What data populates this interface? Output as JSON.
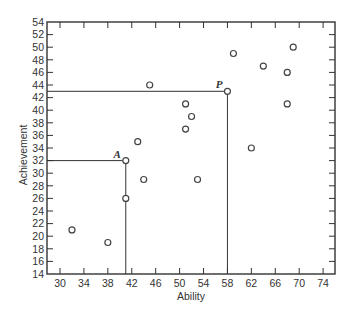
{
  "chart_data": {
    "type": "scatter",
    "title": "",
    "xlabel": "Ability",
    "ylabel": "Achievement",
    "xlim": [
      28,
      76
    ],
    "ylim": [
      14,
      54
    ],
    "xticks": [
      30,
      34,
      38,
      42,
      46,
      50,
      54,
      58,
      62,
      66,
      70,
      74
    ],
    "yticks": [
      14,
      16,
      18,
      20,
      22,
      24,
      26,
      28,
      30,
      32,
      34,
      36,
      38,
      40,
      42,
      44,
      46,
      48,
      50,
      52,
      54
    ],
    "grid": false,
    "legend": null,
    "marker": "open-circle",
    "series": [
      {
        "name": "students",
        "points": [
          {
            "x": 32,
            "y": 21
          },
          {
            "x": 38,
            "y": 19
          },
          {
            "x": 41,
            "y": 32,
            "label": "A"
          },
          {
            "x": 41,
            "y": 26
          },
          {
            "x": 43,
            "y": 35
          },
          {
            "x": 44,
            "y": 29
          },
          {
            "x": 45,
            "y": 44
          },
          {
            "x": 51,
            "y": 41
          },
          {
            "x": 52,
            "y": 39
          },
          {
            "x": 51,
            "y": 37
          },
          {
            "x": 53,
            "y": 29
          },
          {
            "x": 58,
            "y": 43,
            "label": "P"
          },
          {
            "x": 59,
            "y": 49
          },
          {
            "x": 62,
            "y": 34
          },
          {
            "x": 64,
            "y": 47
          },
          {
            "x": 68,
            "y": 46
          },
          {
            "x": 68,
            "y": 41
          },
          {
            "x": 69,
            "y": 50
          }
        ]
      }
    ],
    "annotations": [
      {
        "label": "A",
        "x": 41,
        "y": 32,
        "note": "reference lines drawn to both axes"
      },
      {
        "label": "P",
        "x": 58,
        "y": 43,
        "note": "reference lines drawn to both axes"
      }
    ]
  },
  "colors": {
    "axis": "#333333",
    "marker": "#444444",
    "background": "#ffffff"
  }
}
